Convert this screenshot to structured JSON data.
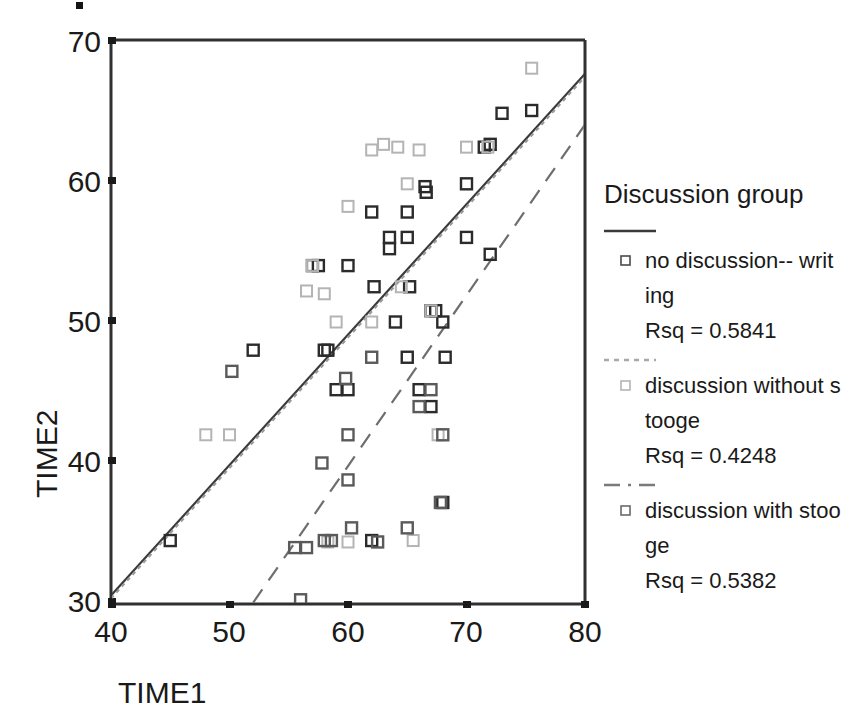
{
  "chart_data": {
    "type": "scatter",
    "title": "",
    "xlabel": "TIME1",
    "ylabel": "TIME2",
    "xlim": [
      40,
      80
    ],
    "ylim": [
      30,
      70
    ],
    "xticks": [
      40,
      50,
      60,
      70,
      80
    ],
    "yticks": [
      30,
      40,
      50,
      60,
      70
    ],
    "grid": false,
    "legend_position": "right",
    "legend_title": "Discussion group",
    "series": [
      {
        "name": "no discussion-- writing",
        "rsq_label": "Rsq = 0.5841",
        "rsq": 0.5841,
        "marker": "open-square-dark",
        "color": "#2b2b2b",
        "line_style": "solid",
        "fit_line": {
          "x1": 40,
          "y1": 30.6,
          "x2": 80,
          "y2": 67.6
        },
        "points": [
          [
            45.0,
            34.5
          ],
          [
            52.0,
            48.0
          ],
          [
            57.0,
            54.0
          ],
          [
            57.5,
            54.0
          ],
          [
            58.0,
            48.0
          ],
          [
            58.3,
            48.0
          ],
          [
            59.0,
            45.2
          ],
          [
            60.0,
            54.0
          ],
          [
            60.0,
            45.2
          ],
          [
            62.0,
            57.8
          ],
          [
            62.2,
            52.5
          ],
          [
            62.0,
            34.5
          ],
          [
            63.5,
            56.0
          ],
          [
            63.5,
            55.2
          ],
          [
            64.0,
            50.0
          ],
          [
            65.0,
            57.8
          ],
          [
            65.0,
            56.0
          ],
          [
            65.2,
            52.5
          ],
          [
            65.0,
            47.5
          ],
          [
            66.0,
            45.2
          ],
          [
            66.5,
            59.6
          ],
          [
            66.6,
            59.2
          ],
          [
            67.0,
            50.8
          ],
          [
            67.4,
            50.8
          ],
          [
            67.0,
            44.0
          ],
          [
            68.0,
            50.0
          ],
          [
            68.2,
            47.5
          ],
          [
            68.0,
            37.2
          ],
          [
            70.0,
            59.8
          ],
          [
            70.0,
            56.0
          ],
          [
            71.5,
            62.4
          ],
          [
            72.0,
            62.6
          ],
          [
            72.0,
            54.8
          ],
          [
            73.0,
            64.8
          ],
          [
            75.5,
            65.0
          ]
        ]
      },
      {
        "name": "discussion without stooge",
        "rsq_label": "Rsq = 0.4248",
        "rsq": 0.4248,
        "marker": "open-square-light",
        "color": "#b4b4b4",
        "line_style": "dotted",
        "fit_line": {
          "x1": 40,
          "y1": 30.4,
          "x2": 80,
          "y2": 67.4
        },
        "points": [
          [
            48.0,
            42.0
          ],
          [
            50.0,
            42.0
          ],
          [
            56.5,
            52.2
          ],
          [
            57.0,
            54.0
          ],
          [
            58.0,
            52.0
          ],
          [
            58.3,
            34.4
          ],
          [
            59.0,
            50.0
          ],
          [
            60.0,
            58.2
          ],
          [
            60.0,
            34.4
          ],
          [
            62.0,
            62.2
          ],
          [
            62.0,
            50.0
          ],
          [
            63.0,
            62.6
          ],
          [
            64.2,
            62.4
          ],
          [
            64.5,
            52.5
          ],
          [
            65.0,
            59.8
          ],
          [
            65.5,
            34.5
          ],
          [
            66.0,
            62.2
          ],
          [
            67.0,
            50.8
          ],
          [
            67.6,
            42.0
          ],
          [
            70.0,
            62.4
          ],
          [
            71.8,
            62.4
          ],
          [
            75.5,
            68.0
          ]
        ]
      },
      {
        "name": "discussion with stooge",
        "rsq_label": "Rsq = 0.5382",
        "rsq": 0.5382,
        "marker": "open-square-mid",
        "color": "#5a5a5a",
        "line_style": "dashed",
        "fit_line": {
          "x1": 52,
          "y1": 30.1,
          "x2": 80,
          "y2": 64.0
        },
        "points": [
          [
            50.2,
            46.5
          ],
          [
            55.5,
            34.0
          ],
          [
            56.0,
            30.3
          ],
          [
            56.5,
            34.0
          ],
          [
            57.8,
            40.0
          ],
          [
            58.0,
            34.5
          ],
          [
            58.6,
            34.5
          ],
          [
            59.8,
            46.0
          ],
          [
            60.0,
            42.0
          ],
          [
            60.0,
            38.8
          ],
          [
            60.3,
            35.4
          ],
          [
            62.0,
            47.5
          ],
          [
            62.5,
            34.4
          ],
          [
            65.0,
            35.4
          ],
          [
            66.0,
            44.0
          ],
          [
            67.0,
            45.2
          ],
          [
            67.8,
            37.2
          ],
          [
            68.0,
            42.0
          ]
        ]
      }
    ]
  },
  "axes": {
    "x_title": "TIME1",
    "y_title": "TIME2",
    "x_tick_labels": [
      "40",
      "50",
      "60",
      "70",
      "80"
    ],
    "y_tick_labels": [
      "30",
      "40",
      "50",
      "60",
      "70"
    ]
  },
  "legend": {
    "title": "Discussion group",
    "entries": [
      {
        "label_line1": "no discussion-- writ",
        "label_line2": "ing",
        "rsq": "Rsq = 0.5841",
        "line_style": "solid"
      },
      {
        "label_line1": "discussion without s",
        "label_line2": "tooge",
        "rsq": "Rsq = 0.4248",
        "line_style": "dotted"
      },
      {
        "label_line1": "discussion with stoo",
        "label_line2": "ge",
        "rsq": "Rsq = 0.5382",
        "line_style": "dashed"
      }
    ]
  },
  "colors": {
    "marker_dark": "#2b2b2b",
    "marker_light": "#b4b4b4",
    "marker_mid": "#5a5a5a",
    "axis": "#303030",
    "text": "#1a1a1a",
    "background": "#ffffff"
  }
}
